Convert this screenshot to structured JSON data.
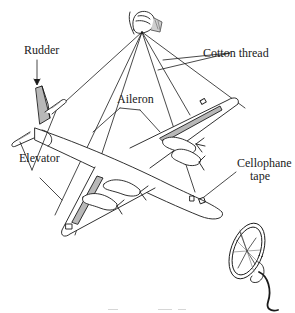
{
  "figure": {
    "type": "line-drawing",
    "labels": {
      "rudder": "Rudder",
      "elevator": "Elevator",
      "aileron": "Aileron",
      "cotton_thread": "Cotton thread",
      "cellophane_tape_line1": "Cellophane",
      "cellophane_tape_line2": "tape"
    },
    "colors": {
      "ink": "#1a1a1a",
      "shade": "#b8b8b8",
      "background": "#ffffff"
    }
  }
}
